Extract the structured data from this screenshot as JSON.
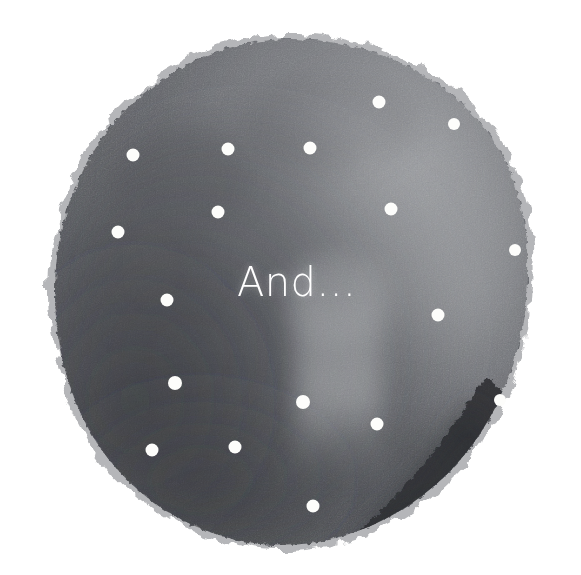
{
  "image": {
    "title": "And...",
    "background_color": "#ffffff",
    "width": 581,
    "height": 575
  },
  "blob": {
    "name": "watercolor-circle",
    "description": "hand painted dark gray watercolor circle with rough feathered edges",
    "base_color": "#53555a",
    "mid_color": "#5e6066",
    "light_color": "#8b8d91",
    "highlight_color": "#9ea0a3",
    "dark_color": "#3a3b3f",
    "darkest_patch_color": "#2e2f33",
    "center_x": 290,
    "center_y": 292,
    "radius_x": 235,
    "radius_y": 253
  },
  "caption": {
    "text": "And...",
    "color": "#ffffff",
    "font_size_px": 40,
    "x": 296,
    "y": 292
  },
  "dots": {
    "color": "#fdfdfb",
    "count": 20,
    "items": [
      {
        "name": "dot-1",
        "x": 379,
        "y": 102,
        "r": 6.5
      },
      {
        "name": "dot-2",
        "x": 454,
        "y": 124,
        "r": 6.0
      },
      {
        "name": "dot-3",
        "x": 133,
        "y": 155,
        "r": 6.5
      },
      {
        "name": "dot-4",
        "x": 228,
        "y": 149,
        "r": 6.5
      },
      {
        "name": "dot-5",
        "x": 310,
        "y": 148,
        "r": 6.5
      },
      {
        "name": "dot-6",
        "x": 218,
        "y": 212,
        "r": 6.5
      },
      {
        "name": "dot-7",
        "x": 391,
        "y": 209,
        "r": 6.5
      },
      {
        "name": "dot-8",
        "x": 118,
        "y": 232,
        "r": 6.5
      },
      {
        "name": "dot-9",
        "x": 515,
        "y": 250,
        "r": 6.0
      },
      {
        "name": "dot-10",
        "x": 167,
        "y": 300,
        "r": 6.5
      },
      {
        "name": "dot-11",
        "x": 438,
        "y": 315,
        "r": 6.5
      },
      {
        "name": "dot-12",
        "x": 175,
        "y": 383,
        "r": 7.0
      },
      {
        "name": "dot-13",
        "x": 303,
        "y": 402,
        "r": 7.0
      },
      {
        "name": "dot-14",
        "x": 500,
        "y": 400,
        "r": 6.0
      },
      {
        "name": "dot-15",
        "x": 377,
        "y": 424,
        "r": 6.5
      },
      {
        "name": "dot-16",
        "x": 152,
        "y": 450,
        "r": 6.5
      },
      {
        "name": "dot-17",
        "x": 235,
        "y": 447,
        "r": 6.5
      },
      {
        "name": "dot-18",
        "x": 313,
        "y": 506,
        "r": 6.5
      }
    ]
  }
}
